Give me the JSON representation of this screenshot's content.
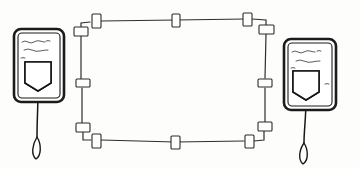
{
  "title": "Hand-drawn sketch: two tagged devices flanking a connector frame",
  "style": {
    "medium": "pen-and-ink line drawing",
    "background_color": "#fdfdfb",
    "ink_color": "#1d1d1d",
    "frame_ink_color": "#2e2e2e",
    "tab_fill_color": "#ffffff",
    "squiggle_color": "#4a4a4a"
  },
  "canvas": {
    "width": 360,
    "height": 169
  },
  "scene": {
    "description": "Two rounded-rectangle cards, one at left and one at right, each with squiggly hand-written lines and a dark hatched shield badge, each trailing a thin stem that ends in a teardrop loop. Between them is a large hand-drawn rectangular frame whose edges carry small white connector tabs.",
    "element_count": 3
  },
  "left_card": {
    "label": "left-tag-card",
    "position": {
      "x": 13,
      "y": 28,
      "width": 52,
      "height": 75
    },
    "corner_radius": 7,
    "text_lines": [
      {
        "id": "line-1",
        "style": "squiggle",
        "length": "long"
      },
      {
        "id": "line-2",
        "style": "squiggle",
        "length": "short"
      },
      {
        "id": "line-3",
        "style": "squiggle",
        "length": "medium"
      }
    ],
    "badge": {
      "name": "shield-badge-icon",
      "shape": "shield",
      "fill": "cross-hatched",
      "position": {
        "x": 24,
        "y": 61,
        "width": 28,
        "height": 30
      }
    },
    "stem": {
      "from_y": 91,
      "to_y": 136,
      "x": 38
    },
    "droplet": {
      "name": "teardrop-icon",
      "cx": 38,
      "cy": 148,
      "rx": 5,
      "ry": 10
    }
  },
  "right_card": {
    "label": "right-tag-card",
    "position": {
      "x": 283,
      "y": 38,
      "width": 54,
      "height": 73
    },
    "corner_radius": 7,
    "text_lines": [
      {
        "id": "line-1",
        "style": "squiggle",
        "length": "long"
      },
      {
        "id": "line-2",
        "style": "squiggle",
        "length": "medium"
      },
      {
        "id": "line-3",
        "style": "squiggle",
        "length": "short"
      }
    ],
    "badge": {
      "name": "shield-badge-icon",
      "shape": "shield",
      "fill": "cross-hatched",
      "position": {
        "x": 294,
        "y": 70,
        "width": 28,
        "height": 30
      }
    },
    "stem": {
      "from_y": 100,
      "to_y": 142,
      "x": 306
    },
    "droplet": {
      "name": "teardrop-icon",
      "cx": 304,
      "cy": 152,
      "rx": 5,
      "ry": 10
    }
  },
  "frame": {
    "label": "connector-frame",
    "shape": "hand-drawn rectangle",
    "bounds": {
      "x": 80,
      "y": 19,
      "width": 186,
      "height": 120
    },
    "tabs": [
      {
        "id": "tab-top-left",
        "orientation": "vertical",
        "x": 96,
        "y": 18
      },
      {
        "id": "tab-top-center",
        "orientation": "vertical",
        "x": 176,
        "y": 20
      },
      {
        "id": "tab-top-right",
        "orientation": "vertical",
        "x": 247,
        "y": 18
      },
      {
        "id": "tab-left-upper",
        "orientation": "horizontal",
        "x": 80,
        "y": 31
      },
      {
        "id": "tab-right-upper",
        "orientation": "horizontal",
        "x": 265,
        "y": 29
      },
      {
        "id": "tab-left-middle",
        "orientation": "horizontal",
        "x": 83,
        "y": 83
      },
      {
        "id": "tab-right-middle",
        "orientation": "horizontal",
        "x": 264,
        "y": 83
      },
      {
        "id": "tab-left-lower",
        "orientation": "horizontal",
        "x": 83,
        "y": 127
      },
      {
        "id": "tab-right-lower",
        "orientation": "horizontal",
        "x": 264,
        "y": 126
      },
      {
        "id": "tab-bottom-left",
        "orientation": "vertical",
        "x": 96,
        "y": 140
      },
      {
        "id": "tab-bottom-center",
        "orientation": "vertical",
        "x": 175,
        "y": 142
      },
      {
        "id": "tab-bottom-right",
        "orientation": "vertical",
        "x": 249,
        "y": 141
      }
    ],
    "tab_count": 12
  }
}
